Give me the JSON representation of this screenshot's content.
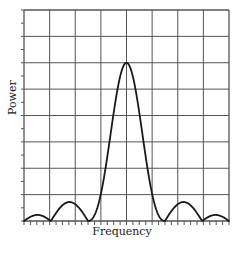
{
  "chart_data": {
    "type": "line",
    "title": "",
    "xlabel": "Frequency",
    "ylabel": "Power",
    "grid": true,
    "xlim": [
      0,
      8
    ],
    "ylim": [
      0,
      8
    ],
    "x_grid_divisions": 8,
    "y_grid_divisions": 8,
    "minor_ticks_per_division_x": 4,
    "minor_ticks_per_division_y": 2,
    "x_tick_labels": [],
    "y_tick_labels": [],
    "series": [
      {
        "name": "Power spectrum",
        "description": "sinc-squared style main lobe centered at x=4 with side lobes",
        "x": [
          0,
          0.45,
          0.9,
          1.4,
          1.85,
          2.5,
          3.0,
          3.5,
          4.0,
          4.5,
          5.0,
          5.5,
          6.15,
          6.6,
          7.1,
          7.55,
          8.0
        ],
        "y": [
          0,
          0.23,
          0,
          0.72,
          0,
          0.05,
          3.2,
          5.4,
          6.0,
          5.4,
          3.2,
          0.05,
          0,
          0.72,
          0,
          0.23,
          0
        ]
      }
    ],
    "annotations": []
  },
  "colors": {
    "grid": "#555555",
    "curve": "#1a1a1a",
    "background": "#ffffff"
  },
  "axes": {
    "x_label": "Frequency",
    "y_label": "Power"
  }
}
